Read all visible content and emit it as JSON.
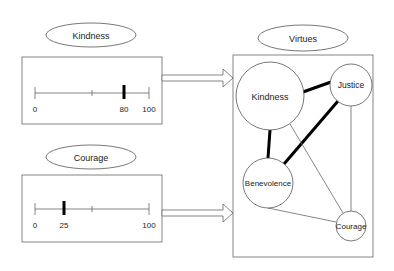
{
  "inputs": [
    {
      "label": "Kindness",
      "slider": {
        "min": 0,
        "max": 100,
        "value": 80,
        "tick_labels": [
          "0",
          "80",
          "100"
        ]
      }
    },
    {
      "label": "Courage",
      "slider": {
        "min": 0,
        "max": 100,
        "value": 25,
        "tick_labels": [
          "0",
          "25",
          "100"
        ]
      }
    }
  ],
  "output": {
    "label": "Virtues",
    "nodes": [
      {
        "id": "kindness",
        "label": "Kindness"
      },
      {
        "id": "justice",
        "label": "Justice"
      },
      {
        "id": "benevolence",
        "label": "Benevolence"
      },
      {
        "id": "courage",
        "label": "Courage"
      }
    ],
    "edges": [
      {
        "from": "kindness",
        "to": "justice",
        "weight": "strong"
      },
      {
        "from": "kindness",
        "to": "benevolence",
        "weight": "strong"
      },
      {
        "from": "justice",
        "to": "benevolence",
        "weight": "strong"
      },
      {
        "from": "kindness",
        "to": "courage",
        "weight": "weak"
      },
      {
        "from": "justice",
        "to": "courage",
        "weight": "weak"
      },
      {
        "from": "benevolence",
        "to": "courage",
        "weight": "weak"
      }
    ]
  },
  "colors": {
    "stroke": "#555555",
    "thick": "#000000",
    "thumb": "#000000"
  }
}
